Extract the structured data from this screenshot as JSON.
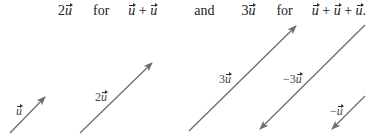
{
  "equation_line": {
    "part1_coef": "2",
    "part1_vec": "u",
    "word_for_1": "for",
    "sum1": [
      "u",
      "+",
      "u"
    ],
    "word_and": "and",
    "part2_coef": "3",
    "part2_vec": "u",
    "word_for_2": "for",
    "sum2": [
      "u",
      "+",
      "u",
      "+",
      "u"
    ],
    "end_punct": "."
  },
  "vectors": [
    {
      "id": "u",
      "label_coef": "",
      "label_vec": "u",
      "x1": 10,
      "y1": 133,
      "x2": 45,
      "y2": 97,
      "label_x": 16,
      "label_y": 104
    },
    {
      "id": "2u",
      "label_coef": "2",
      "label_vec": "u",
      "x1": 80,
      "y1": 133,
      "x2": 152,
      "y2": 63,
      "label_x": 95,
      "label_y": 90
    },
    {
      "id": "3u",
      "label_coef": "3",
      "label_vec": "u",
      "x1": 189,
      "y1": 131,
      "x2": 296,
      "y2": 26,
      "label_x": 219,
      "label_y": 72
    },
    {
      "id": "neg3u",
      "label_coef": "−3",
      "label_vec": "u",
      "x1": 365,
      "y1": 25,
      "x2": 260,
      "y2": 129,
      "label_x": 283,
      "label_y": 72
    },
    {
      "id": "negu",
      "label_coef": "−",
      "label_vec": "u",
      "x1": 365,
      "y1": 96,
      "x2": 332,
      "y2": 129,
      "label_x": 330,
      "label_y": 104
    }
  ],
  "colors": {
    "arrow": "#6e6e6e",
    "text": "#222222"
  }
}
